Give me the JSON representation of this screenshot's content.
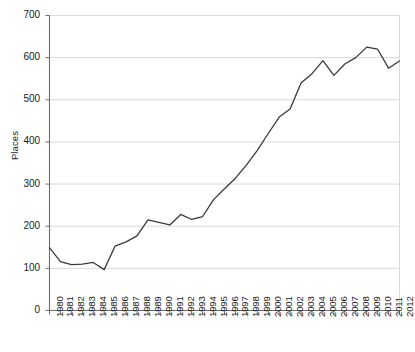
{
  "chart_data": {
    "type": "line",
    "title": "",
    "subtitle": "",
    "xlabel": "",
    "ylabel": "Places",
    "ylim": [
      0,
      700
    ],
    "ytick_values": [
      0,
      100,
      200,
      300,
      400,
      500,
      600,
      700
    ],
    "ytick_labels": [
      "0",
      "100",
      "200",
      "300",
      "400",
      "500",
      "600",
      "700"
    ],
    "grid": "horizontal",
    "legend": "none",
    "line_color": "#3a3a3a",
    "grid_color": "#d9d9d9",
    "axis_color": "#6b6b6b",
    "categories": [
      "1980",
      "1981",
      "1982",
      "1983",
      "1984",
      "1985",
      "1986",
      "1987",
      "1988",
      "1989",
      "1990",
      "1991",
      "1992",
      "1993",
      "1994",
      "1995",
      "1996",
      "1997",
      "1998",
      "1999",
      "2000",
      "2001",
      "2002",
      "2003",
      "2004",
      "2005",
      "2006",
      "2007",
      "2008",
      "2009",
      "2010",
      "2011",
      "2012"
    ],
    "values": [
      149,
      116,
      109,
      110,
      114,
      97,
      153,
      163,
      177,
      215,
      209,
      203,
      228,
      216,
      223,
      263,
      289,
      314,
      345,
      380,
      420,
      459,
      478,
      540,
      562,
      593,
      558,
      585,
      600,
      625,
      620,
      575,
      592
    ]
  }
}
